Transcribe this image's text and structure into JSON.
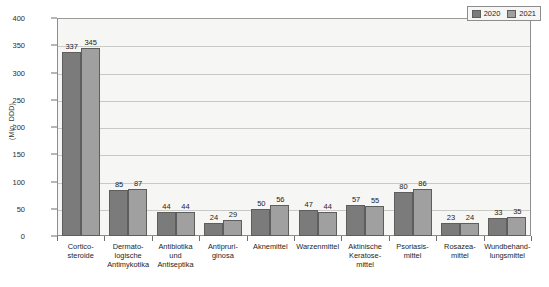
{
  "chart_data": {
    "type": "bar",
    "title": "",
    "xlabel": "",
    "ylabel": "(Mio. DDD)",
    "ylim": [
      0,
      400
    ],
    "yticks": [
      0,
      50,
      100,
      150,
      200,
      250,
      300,
      350,
      400
    ],
    "grid": true,
    "legend_position": "top-right",
    "categories": [
      "Cortico-\nsteroide",
      "Dermato-\nlogische\nAntimykotika",
      "Antibiotika\nund\nAntiseptika",
      "Antipruri-\nginosa",
      "Aknemittel",
      "Warzenmittel",
      "Aktinische\nKeratose-\nmittel",
      "Psoriasis-\nmittel",
      "Rosazea-\nmittel",
      "Wundbehand-\nlungsmittel"
    ],
    "category_lines": [
      [
        "Cortico-",
        "steroide"
      ],
      [
        "Dermato-",
        "logische",
        "Antimykotika"
      ],
      [
        "Antibiotika",
        "und",
        "Antiseptika"
      ],
      [
        "Antipruri-",
        "ginosa"
      ],
      [
        "Aknemittel"
      ],
      [
        "Warzenmittel"
      ],
      [
        "Aktinische",
        "Keratose-",
        "mittel"
      ],
      [
        "Psoriasis-",
        "mittel"
      ],
      [
        "Rosazea-",
        "mittel"
      ],
      [
        "Wundbehand-",
        "lungsmittel"
      ]
    ],
    "series": [
      {
        "name": "2020",
        "color": "#7b7b7b",
        "values": [
          337,
          85,
          44,
          24,
          50,
          47,
          57,
          80,
          23,
          33
        ]
      },
      {
        "name": "2021",
        "color": "#a0a0a0",
        "values": [
          345,
          87,
          44,
          29,
          56,
          44,
          55,
          86,
          24,
          35
        ]
      }
    ]
  },
  "legend": {
    "items": [
      {
        "label": "2020",
        "color": "#7b7b7b"
      },
      {
        "label": "2021",
        "color": "#a0a0a0"
      }
    ]
  },
  "axis": {
    "y_title": "(Mio. DDD)",
    "y_tick_labels": [
      "400",
      "350",
      "300",
      "250",
      "200",
      "150",
      "100",
      "50",
      "0"
    ]
  }
}
